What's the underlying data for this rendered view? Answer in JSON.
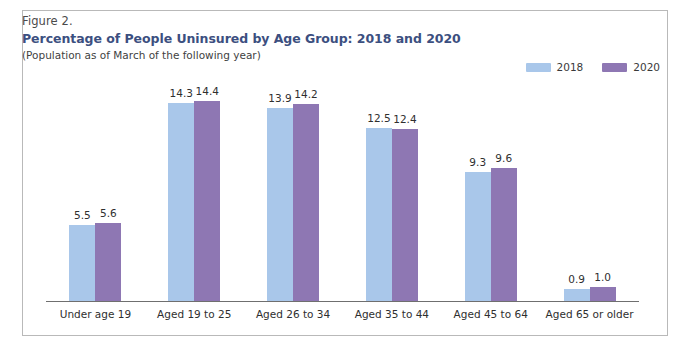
{
  "figure": {
    "number": "Figure 2.",
    "title": "Percentage of People Uninsured by Age Group: 2018 and 2020",
    "subtitle": "(Population as of March of the following year)"
  },
  "colors": {
    "series_2018": "#a9c7ea",
    "series_2020": "#8e77b3",
    "title": "#3c4f80",
    "axis": "#6f6f6f",
    "frame": "#b9b9b9"
  },
  "legend": {
    "position": "top-right",
    "items": [
      {
        "label": "2018",
        "color": "#a9c7ea"
      },
      {
        "label": "2020",
        "color": "#8e77b3"
      }
    ]
  },
  "chart_data": {
    "type": "bar",
    "title": "Percentage of People Uninsured by Age Group: 2018 and 2020",
    "subtitle": "(Population as of March of the following year)",
    "xlabel": "",
    "ylabel": "",
    "ylim": [
      0,
      16
    ],
    "grid": false,
    "categories": [
      "Under age 19",
      "Aged 19 to 25",
      "Aged 26 to 34",
      "Aged 35 to 44",
      "Aged 45 to 64",
      "Aged 65 or older"
    ],
    "series": [
      {
        "name": "2018",
        "color": "#a9c7ea",
        "values": [
          5.5,
          14.3,
          13.9,
          12.5,
          9.3,
          0.9
        ],
        "labels": [
          "5.5",
          "14.3",
          "13.9",
          "12.5",
          "9.3",
          "0.9"
        ]
      },
      {
        "name": "2020",
        "color": "#8e77b3",
        "values": [
          5.6,
          14.4,
          14.2,
          12.4,
          9.6,
          1.0
        ],
        "labels": [
          "5.6",
          "14.4",
          "14.2",
          "12.4",
          "9.6",
          "1.0"
        ]
      }
    ]
  }
}
